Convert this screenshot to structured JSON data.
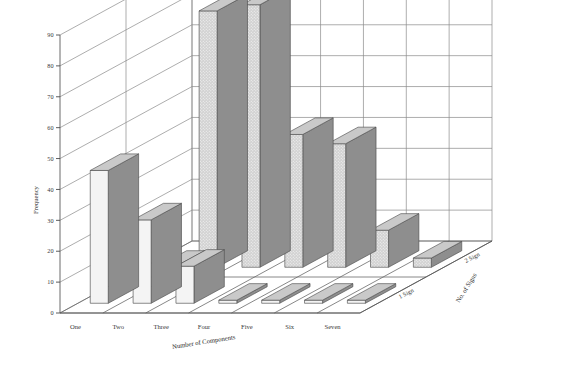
{
  "chart_data": {
    "type": "bar",
    "title": "",
    "subtitle": "",
    "xlabel": "Number of Components",
    "ylabel": "Frequency",
    "zlabel": "No. of Signs",
    "categories": [
      "One",
      "Two",
      "Three",
      "Four",
      "Five",
      "Six",
      "Seven"
    ],
    "ytick_labels": [
      "0",
      "10",
      "20",
      "30",
      "40",
      "50",
      "60",
      "70",
      "80",
      "90"
    ],
    "ytick_values": [
      0,
      10,
      20,
      30,
      40,
      50,
      60,
      70,
      80,
      90
    ],
    "ylim": [
      0,
      90
    ],
    "grid": true,
    "legend_position": "none",
    "depth_categories": [
      "1 Sign",
      "2 Sign"
    ],
    "series": [
      {
        "name": "1 Sign",
        "fill": "white",
        "values": [
          43,
          27,
          12,
          1,
          1,
          1,
          1
        ]
      },
      {
        "name": "2 Sign",
        "fill": "hatched-grey",
        "values": [
          0,
          83,
          85,
          43,
          40,
          12,
          3
        ]
      }
    ],
    "colors": {
      "bar_front_light": "#f4f4f4",
      "bar_front_hatch": "#d2d2d2",
      "bar_side": "#8e8e8e",
      "bar_top": "#c9c9c9",
      "grid": "#8a8a8a",
      "axis": "#5a5a5a",
      "text": "#3a3a3a",
      "background": "#ffffff"
    }
  },
  "axes": {
    "y_title": "Frequency",
    "x_title": "Number of Components",
    "z_title": "No. of Signs"
  }
}
